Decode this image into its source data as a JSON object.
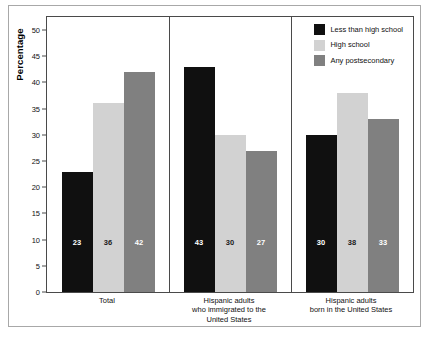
{
  "chart_data": {
    "type": "bar",
    "title": "",
    "xlabel": "",
    "ylabel": "Percentage",
    "ylim": [
      0,
      52.5
    ],
    "yticks": [
      0,
      5,
      10,
      15,
      20,
      25,
      30,
      35,
      40,
      45,
      50
    ],
    "grid": false,
    "legend_position": "top-right",
    "categories": [
      "Total",
      "Hispanic adults who immigrated to the United States",
      "Hispanic adults born in the United States"
    ],
    "category_lines": [
      [
        "Total"
      ],
      [
        "Hispanic adults",
        "who immigrated to the",
        "United States"
      ],
      [
        "Hispanic adults",
        "born in the United States"
      ]
    ],
    "series": [
      {
        "name": "Less than high school",
        "color": "#101010",
        "values": [
          23,
          43,
          30
        ]
      },
      {
        "name": "High school",
        "color": "#d2d2d2",
        "values": [
          36,
          30,
          38
        ]
      },
      {
        "name": "Any postsecondary",
        "color": "#808080",
        "values": [
          42,
          27,
          33
        ]
      }
    ]
  },
  "legend": {
    "items": [
      {
        "label": "Less than high school",
        "swatch": "legend-swatch-less-than-high-school"
      },
      {
        "label": "High school",
        "swatch": "legend-swatch-high-school"
      },
      {
        "label": "Any postsecondary",
        "swatch": "legend-swatch-any-postsecondary"
      }
    ]
  }
}
